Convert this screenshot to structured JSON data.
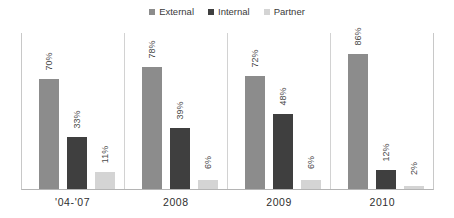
{
  "chart_data": {
    "type": "bar",
    "title": "",
    "subtitle": "",
    "xlabel": "",
    "ylabel": "",
    "ylim": [
      0,
      100
    ],
    "grid": false,
    "legend_position": "top-center",
    "value_label_suffix": "%",
    "value_labels_rotated": true,
    "categories": [
      "'04-'07",
      "2008",
      "2009",
      "2010"
    ],
    "series": [
      {
        "name": "External",
        "color": "#8c8c8c",
        "values": [
          70,
          78,
          72,
          86
        ]
      },
      {
        "name": "Internal",
        "color": "#3f3f3f",
        "values": [
          33,
          39,
          48,
          12
        ]
      },
      {
        "name": "Partner",
        "color": "#d4d4d4",
        "values": [
          11,
          6,
          6,
          2
        ]
      }
    ],
    "value_labels": [
      [
        "70%",
        "33%",
        "11%"
      ],
      [
        "78%",
        "39%",
        "6%"
      ],
      [
        "72%",
        "48%",
        "6%"
      ],
      [
        "86%",
        "12%",
        "2%"
      ]
    ]
  },
  "legend": {
    "items": [
      {
        "label": "External",
        "color": "#8c8c8c"
      },
      {
        "label": "Internal",
        "color": "#3f3f3f"
      },
      {
        "label": "Partner",
        "color": "#d4d4d4"
      }
    ]
  },
  "axis": {
    "categories": [
      "'04-'07",
      "2008",
      "2009",
      "2010"
    ]
  },
  "colors": {
    "external": "#8c8c8c",
    "internal": "#3f3f3f",
    "partner": "#d4d4d4",
    "axis_line": "#b4b4b4",
    "separator": "#d2d2d2",
    "text": "#3a3a3a"
  }
}
